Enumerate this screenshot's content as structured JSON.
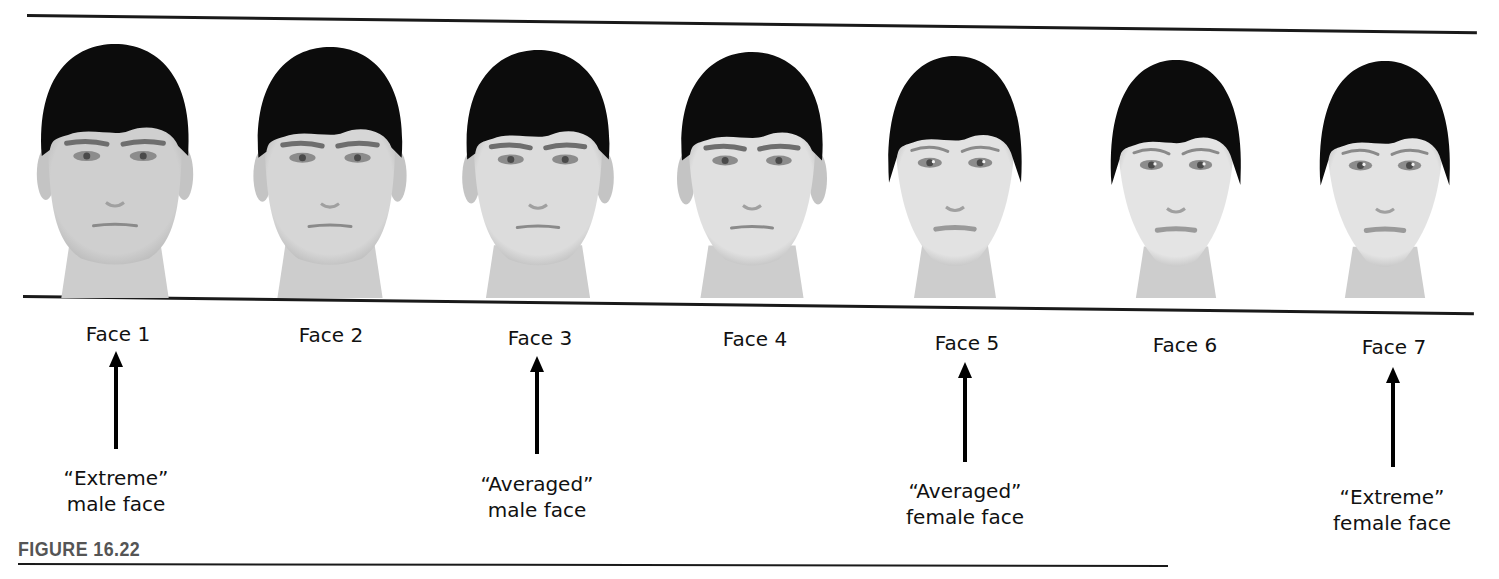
{
  "figure": {
    "label": "FIGURE 16.22",
    "colors": {
      "hair": "#0c0c0c",
      "skin_male": "#d4d4d4",
      "skin_female": "#e2e2e2",
      "rule": "#1a1a1a",
      "figure_label": "#555555"
    }
  },
  "faces": [
    {
      "label": "Face 1",
      "sex": "male",
      "cx": 115,
      "top": 40,
      "skin": "#cfcfcf",
      "width": 168,
      "jaw": 0.92
    },
    {
      "label": "Face 2",
      "sex": "male",
      "cx": 330,
      "top": 43,
      "skin": "#d6d6d6",
      "width": 164,
      "jaw": 0.88
    },
    {
      "label": "Face 3",
      "sex": "male",
      "cx": 538,
      "top": 46,
      "skin": "#dcdcdc",
      "width": 162,
      "jaw": 0.82
    },
    {
      "label": "Face 4",
      "sex": "male",
      "cx": 752,
      "top": 48,
      "skin": "#e0e0e0",
      "width": 160,
      "jaw": 0.76
    },
    {
      "label": "Face 5",
      "sex": "female",
      "cx": 955,
      "top": 52,
      "skin": "#e2e2e2",
      "width": 150,
      "jaw": 0.66
    },
    {
      "label": "Face 6",
      "sex": "female",
      "cx": 1176,
      "top": 56,
      "skin": "#e4e4e4",
      "width": 146,
      "jaw": 0.62
    },
    {
      "label": "Face 7",
      "sex": "female",
      "cx": 1385,
      "top": 57,
      "skin": "#e3e3e3",
      "width": 146,
      "jaw": 0.58
    }
  ],
  "annotations": [
    {
      "target": "Face 1",
      "line1": "“Extreme”",
      "line2": "male face"
    },
    {
      "target": "Face 3",
      "line1": "“Averaged”",
      "line2": "male face"
    },
    {
      "target": "Face 5",
      "line1": "“Averaged”",
      "line2": "female face"
    },
    {
      "target": "Face 7",
      "line1": "“Extreme”",
      "line2": "female face"
    }
  ]
}
